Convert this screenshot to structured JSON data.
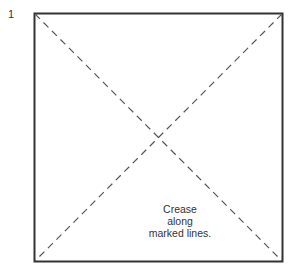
{
  "step_number": "1",
  "caption": {
    "lines": [
      "Crease",
      "along",
      "marked lines."
    ]
  },
  "diagram": {
    "shape": "square",
    "fold_lines": [
      "diagonal top-left to bottom-right",
      "diagonal top-right to bottom-left"
    ],
    "line_style": "dashed",
    "stroke_color": "#333333"
  }
}
